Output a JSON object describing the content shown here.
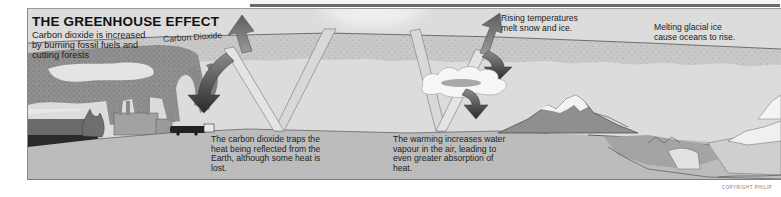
{
  "diagram": {
    "title": "THE GREENHOUSE EFFECT",
    "intro_lines": [
      "Carbon dioxide is increased",
      "by burning fossil fuels and",
      "cutting forests"
    ],
    "atmosphere_label": "Carbon Dioxide",
    "captions": {
      "rising_temperatures": [
        "Rising temperatures",
        "melt snow and ice."
      ],
      "melting_ice": [
        "Melting glacial ice",
        "cause oceans to rise."
      ],
      "co2_traps_heat": [
        "The carbon dioxide traps the",
        "heat being reflected from the",
        "Earth, although some heat is",
        "lost."
      ],
      "water_vapour": [
        "The warming increases water",
        "vapour in the air, leading to",
        "even greater absorption of",
        "heat."
      ]
    },
    "copyright": "COPYRIGHT PHILIP"
  },
  "colors": {
    "sky": "#dcdcdc",
    "atmosphere_band": "#c4c4c4",
    "ground": "#bcbcbc",
    "smoke": "#8e8e8e",
    "heat_arrow_dark": "#4a4a4a",
    "light_beam": "#d7d7d7",
    "mountain": "#8f8f8f",
    "text": "#222222"
  },
  "elements": [
    "sun-glow",
    "light-beams",
    "heat-arrows",
    "cloud",
    "factory-chimneys",
    "burning-forest",
    "lorry",
    "mountain",
    "glacier",
    "coastline"
  ]
}
